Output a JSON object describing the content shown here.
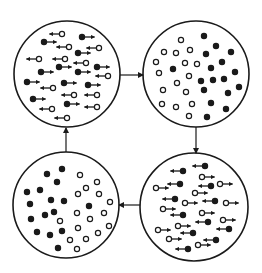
{
  "colors": {
    "ink": "#1a1a1a",
    "background": "#ffffff"
  },
  "dot_radius": 2.6,
  "arrow_length": 10,
  "panels": [
    {
      "id": "top-left",
      "state": "polarized-mixed",
      "cx": 67,
      "cy": 74,
      "r": 53,
      "particles": [
        {
          "x": 62,
          "y": 34,
          "fill": "open",
          "dir": -1
        },
        {
          "x": 82,
          "y": 37,
          "fill": "filled",
          "dir": 1
        },
        {
          "x": 44,
          "y": 42,
          "fill": "filled",
          "dir": 1
        },
        {
          "x": 69,
          "y": 47,
          "fill": "open",
          "dir": -1
        },
        {
          "x": 99,
          "y": 48,
          "fill": "open",
          "dir": -1
        },
        {
          "x": 78,
          "y": 53,
          "fill": "filled",
          "dir": 1
        },
        {
          "x": 39,
          "y": 59,
          "fill": "open",
          "dir": -1
        },
        {
          "x": 65,
          "y": 59,
          "fill": "open",
          "dir": -1
        },
        {
          "x": 86,
          "y": 63,
          "fill": "open",
          "dir": -1
        },
        {
          "x": 59,
          "y": 67,
          "fill": "filled",
          "dir": 1
        },
        {
          "x": 97,
          "y": 67,
          "fill": "filled",
          "dir": 1
        },
        {
          "x": 41,
          "y": 72,
          "fill": "filled",
          "dir": 1
        },
        {
          "x": 78,
          "y": 72,
          "fill": "filled",
          "dir": 1
        },
        {
          "x": 108,
          "y": 76,
          "fill": "open",
          "dir": -1
        },
        {
          "x": 27,
          "y": 82,
          "fill": "filled",
          "dir": 1
        },
        {
          "x": 64,
          "y": 83,
          "fill": "filled",
          "dir": 1
        },
        {
          "x": 88,
          "y": 85,
          "fill": "filled",
          "dir": 1
        },
        {
          "x": 53,
          "y": 88,
          "fill": "open",
          "dir": -1
        },
        {
          "x": 74,
          "y": 95,
          "fill": "open",
          "dir": -1
        },
        {
          "x": 97,
          "y": 95,
          "fill": "open",
          "dir": -1
        },
        {
          "x": 33,
          "y": 99,
          "fill": "filled",
          "dir": 1
        },
        {
          "x": 67,
          "y": 104,
          "fill": "filled",
          "dir": 1
        },
        {
          "x": 52,
          "y": 109,
          "fill": "open",
          "dir": -1
        },
        {
          "x": 97,
          "y": 107,
          "fill": "open",
          "dir": -1
        },
        {
          "x": 67,
          "y": 118,
          "fill": "open",
          "dir": -1
        }
      ]
    },
    {
      "id": "top-right",
      "state": "separated",
      "cx": 196,
      "cy": 74,
      "r": 53,
      "particles": [
        {
          "x": 181,
          "y": 40,
          "fill": "open",
          "dir": 0
        },
        {
          "x": 164,
          "y": 52,
          "fill": "open",
          "dir": 0
        },
        {
          "x": 176,
          "y": 53,
          "fill": "open",
          "dir": 0
        },
        {
          "x": 190,
          "y": 50,
          "fill": "open",
          "dir": 0
        },
        {
          "x": 156,
          "y": 62,
          "fill": "open",
          "dir": 0
        },
        {
          "x": 185,
          "y": 63,
          "fill": "open",
          "dir": 0
        },
        {
          "x": 197,
          "y": 64,
          "fill": "open",
          "dir": 0
        },
        {
          "x": 159,
          "y": 73,
          "fill": "open",
          "dir": 0
        },
        {
          "x": 189,
          "y": 76,
          "fill": "open",
          "dir": 0
        },
        {
          "x": 177,
          "y": 83,
          "fill": "open",
          "dir": 0
        },
        {
          "x": 163,
          "y": 90,
          "fill": "open",
          "dir": 0
        },
        {
          "x": 186,
          "y": 92,
          "fill": "open",
          "dir": 0
        },
        {
          "x": 162,
          "y": 104,
          "fill": "open",
          "dir": 0
        },
        {
          "x": 176,
          "y": 107,
          "fill": "open",
          "dir": 0
        },
        {
          "x": 192,
          "y": 104,
          "fill": "open",
          "dir": 0
        },
        {
          "x": 189,
          "y": 116,
          "fill": "open",
          "dir": 0
        },
        {
          "x": 204,
          "y": 36,
          "fill": "filled",
          "dir": 0
        },
        {
          "x": 216,
          "y": 46,
          "fill": "filled",
          "dir": 0
        },
        {
          "x": 231,
          "y": 52,
          "fill": "filled",
          "dir": 0
        },
        {
          "x": 206,
          "y": 54,
          "fill": "filled",
          "dir": 0
        },
        {
          "x": 222,
          "y": 62,
          "fill": "filled",
          "dir": 0
        },
        {
          "x": 211,
          "y": 68,
          "fill": "filled",
          "dir": 0
        },
        {
          "x": 235,
          "y": 72,
          "fill": "filled",
          "dir": 0
        },
        {
          "x": 173,
          "y": 69,
          "fill": "filled",
          "dir": 0
        },
        {
          "x": 201,
          "y": 81,
          "fill": "filled",
          "dir": 0
        },
        {
          "x": 213,
          "y": 80,
          "fill": "filled",
          "dir": 0
        },
        {
          "x": 224,
          "y": 79,
          "fill": "filled",
          "dir": 0
        },
        {
          "x": 204,
          "y": 90,
          "fill": "filled",
          "dir": 0
        },
        {
          "x": 228,
          "y": 93,
          "fill": "filled",
          "dir": 0
        },
        {
          "x": 239,
          "y": 87,
          "fill": "filled",
          "dir": 0
        },
        {
          "x": 211,
          "y": 103,
          "fill": "filled",
          "dir": 0
        },
        {
          "x": 226,
          "y": 109,
          "fill": "filled",
          "dir": 0
        },
        {
          "x": 207,
          "y": 117,
          "fill": "filled",
          "dir": 0
        }
      ]
    },
    {
      "id": "bottom-right",
      "state": "reversed-polarized-mixed",
      "cx": 194,
      "cy": 207,
      "r": 54,
      "particles": [
        {
          "x": 205,
          "y": 166,
          "fill": "filled",
          "dir": -1
        },
        {
          "x": 183,
          "y": 171,
          "fill": "filled",
          "dir": -1
        },
        {
          "x": 180,
          "y": 184,
          "fill": "filled",
          "dir": -1
        },
        {
          "x": 211,
          "y": 186,
          "fill": "filled",
          "dir": -1
        },
        {
          "x": 175,
          "y": 199,
          "fill": "filled",
          "dir": -1
        },
        {
          "x": 215,
          "y": 201,
          "fill": "filled",
          "dir": -1
        },
        {
          "x": 183,
          "y": 215,
          "fill": "filled",
          "dir": -1
        },
        {
          "x": 208,
          "y": 222,
          "fill": "filled",
          "dir": -1
        },
        {
          "x": 193,
          "y": 233,
          "fill": "filled",
          "dir": -1
        },
        {
          "x": 229,
          "y": 229,
          "fill": "filled",
          "dir": -1
        },
        {
          "x": 216,
          "y": 240,
          "fill": "filled",
          "dir": -1
        },
        {
          "x": 188,
          "y": 249,
          "fill": "filled",
          "dir": -1
        },
        {
          "x": 202,
          "y": 177,
          "fill": "open",
          "dir": 1
        },
        {
          "x": 156,
          "y": 188,
          "fill": "open",
          "dir": 1
        },
        {
          "x": 220,
          "y": 184,
          "fill": "open",
          "dir": 1
        },
        {
          "x": 195,
          "y": 193,
          "fill": "open",
          "dir": 1
        },
        {
          "x": 185,
          "y": 203,
          "fill": "open",
          "dir": 1
        },
        {
          "x": 226,
          "y": 203,
          "fill": "open",
          "dir": 1
        },
        {
          "x": 163,
          "y": 209,
          "fill": "open",
          "dir": 1
        },
        {
          "x": 202,
          "y": 213,
          "fill": "open",
          "dir": 1
        },
        {
          "x": 223,
          "y": 220,
          "fill": "open",
          "dir": 1
        },
        {
          "x": 178,
          "y": 226,
          "fill": "open",
          "dir": 1
        },
        {
          "x": 158,
          "y": 230,
          "fill": "open",
          "dir": 1
        },
        {
          "x": 169,
          "y": 239,
          "fill": "open",
          "dir": 1
        },
        {
          "x": 198,
          "y": 245,
          "fill": "open",
          "dir": 1
        }
      ]
    },
    {
      "id": "bottom-left",
      "state": "reversed-separated",
      "cx": 66,
      "cy": 205,
      "r": 53,
      "particles": [
        {
          "x": 62,
          "y": 169,
          "fill": "filled",
          "dir": 0
        },
        {
          "x": 47,
          "y": 174,
          "fill": "filled",
          "dir": 0
        },
        {
          "x": 57,
          "y": 182,
          "fill": "filled",
          "dir": 0
        },
        {
          "x": 27,
          "y": 192,
          "fill": "filled",
          "dir": 0
        },
        {
          "x": 40,
          "y": 190,
          "fill": "filled",
          "dir": 0
        },
        {
          "x": 51,
          "y": 200,
          "fill": "filled",
          "dir": 0
        },
        {
          "x": 64,
          "y": 201,
          "fill": "filled",
          "dir": 0
        },
        {
          "x": 30,
          "y": 204,
          "fill": "filled",
          "dir": 0
        },
        {
          "x": 89,
          "y": 206,
          "fill": "filled",
          "dir": 0
        },
        {
          "x": 31,
          "y": 219,
          "fill": "filled",
          "dir": 0
        },
        {
          "x": 45,
          "y": 215,
          "fill": "filled",
          "dir": 0
        },
        {
          "x": 54,
          "y": 212,
          "fill": "filled",
          "dir": 0
        },
        {
          "x": 37,
          "y": 232,
          "fill": "filled",
          "dir": 0
        },
        {
          "x": 50,
          "y": 235,
          "fill": "filled",
          "dir": 0
        },
        {
          "x": 62,
          "y": 231,
          "fill": "filled",
          "dir": 0
        },
        {
          "x": 58,
          "y": 248,
          "fill": "filled",
          "dir": 0
        },
        {
          "x": 80,
          "y": 175,
          "fill": "open",
          "dir": 0
        },
        {
          "x": 97,
          "y": 182,
          "fill": "open",
          "dir": 0
        },
        {
          "x": 86,
          "y": 188,
          "fill": "open",
          "dir": 0
        },
        {
          "x": 78,
          "y": 194,
          "fill": "open",
          "dir": 0
        },
        {
          "x": 99,
          "y": 194,
          "fill": "open",
          "dir": 0
        },
        {
          "x": 110,
          "y": 202,
          "fill": "open",
          "dir": 0
        },
        {
          "x": 77,
          "y": 213,
          "fill": "open",
          "dir": 0
        },
        {
          "x": 104,
          "y": 213,
          "fill": "open",
          "dir": 0
        },
        {
          "x": 90,
          "y": 219,
          "fill": "open",
          "dir": 0
        },
        {
          "x": 60,
          "y": 221,
          "fill": "open",
          "dir": 0
        },
        {
          "x": 78,
          "y": 228,
          "fill": "open",
          "dir": 0
        },
        {
          "x": 109,
          "y": 226,
          "fill": "open",
          "dir": 0
        },
        {
          "x": 98,
          "y": 233,
          "fill": "open",
          "dir": 0
        },
        {
          "x": 70,
          "y": 240,
          "fill": "open",
          "dir": 0
        },
        {
          "x": 86,
          "y": 239,
          "fill": "open",
          "dir": 0
        },
        {
          "x": 77,
          "y": 249,
          "fill": "open",
          "dir": 0
        }
      ]
    }
  ],
  "connectors": [
    {
      "id": "top-left-to-top-right",
      "x1": 120,
      "y1": 75,
      "x2": 143,
      "y2": 75
    },
    {
      "id": "top-right-to-bottom-right",
      "x1": 196,
      "y1": 127,
      "x2": 196,
      "y2": 153
    },
    {
      "id": "bottom-right-to-bottom-left",
      "x1": 140,
      "y1": 205,
      "x2": 119,
      "y2": 205
    },
    {
      "id": "bottom-left-to-top-left",
      "x1": 66,
      "y1": 152,
      "x2": 66,
      "y2": 128
    }
  ]
}
